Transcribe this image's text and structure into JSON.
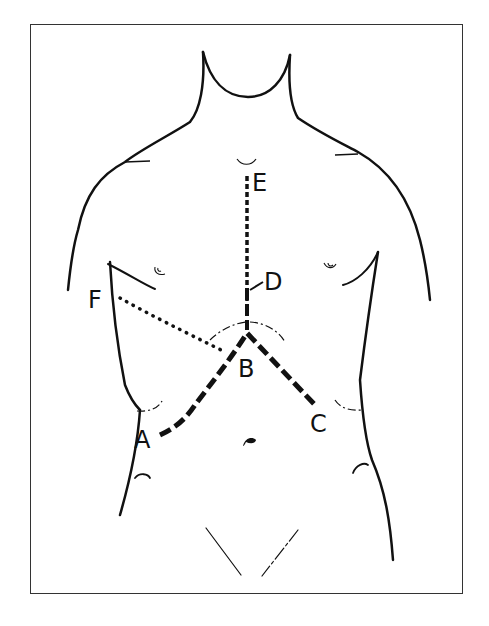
{
  "diagram": {
    "labels": {
      "A": "A",
      "B": "B",
      "C": "C",
      "D": "D",
      "E": "E",
      "F": "F"
    },
    "line_styles": {
      "E_to_B": "short-dashed (midline)",
      "A_B_C": "long-dashed (chevron)",
      "F_to_B": "dotted"
    },
    "colors": {
      "stroke": "#111111",
      "background": "#ffffff",
      "border": "#333333"
    }
  }
}
